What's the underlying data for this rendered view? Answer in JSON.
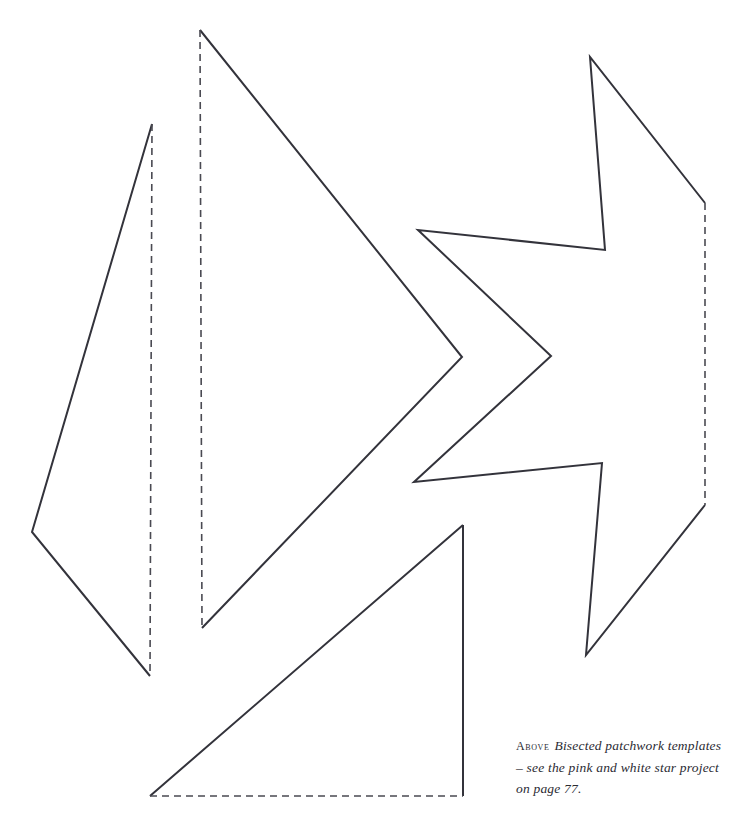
{
  "page": {
    "background_color": "#ffffff",
    "width": 744,
    "height": 824
  },
  "caption": {
    "label": "Above",
    "line1": "Bisected patchwork templates",
    "line2": "– see the pink and white star project",
    "line3": "on page 77.",
    "full_text": "ABOVE Bisected patchwork templates – see the pink and white star project on page 77.",
    "color": "#2b2b33"
  },
  "diagram": {
    "title": "Bisected patchwork templates",
    "stroke_color": "#33333b",
    "stroke_width": 2,
    "dash_pattern": "7 5",
    "shapes": [
      {
        "id": "left-kite-template",
        "name": "left-kite-template",
        "solid_path": "M 152,124 L 32,532 L 150,676",
        "dashed_path": "M 152,124 L 150,676",
        "vertices": [
          [
            152,
            124
          ],
          [
            32,
            532
          ],
          [
            150,
            676
          ]
        ]
      },
      {
        "id": "middle-triangle-template",
        "name": "middle-triangle-template",
        "solid_path": "M 200,30 L 462,357 L 202,628",
        "dashed_path": "M 200,30 L 202,628",
        "vertices": [
          [
            200,
            30
          ],
          [
            462,
            357
          ],
          [
            202,
            628
          ]
        ]
      },
      {
        "id": "right-star-half-template",
        "name": "right-star-half-template",
        "solid_path": "M 705,203 L 590,57 L 605,250 L 418,230 L 551,356 L 414,482 L 602,463 L 586,655 L 705,505",
        "dashed_path": "M 705,203 L 705,505",
        "vertices": [
          [
            705,
            203
          ],
          [
            590,
            57
          ],
          [
            605,
            250
          ],
          [
            418,
            230
          ],
          [
            551,
            356
          ],
          [
            414,
            482
          ],
          [
            602,
            463
          ],
          [
            586,
            655
          ],
          [
            705,
            505
          ]
        ]
      },
      {
        "id": "bottom-triangle-template",
        "name": "bottom-triangle-template",
        "solid_path": "M 463,525 L 150,796 M 463,525 L 463,796",
        "dashed_path": "M 150,796 L 463,796",
        "vertices": [
          [
            463,
            525
          ],
          [
            150,
            796
          ],
          [
            463,
            796
          ]
        ]
      }
    ]
  }
}
